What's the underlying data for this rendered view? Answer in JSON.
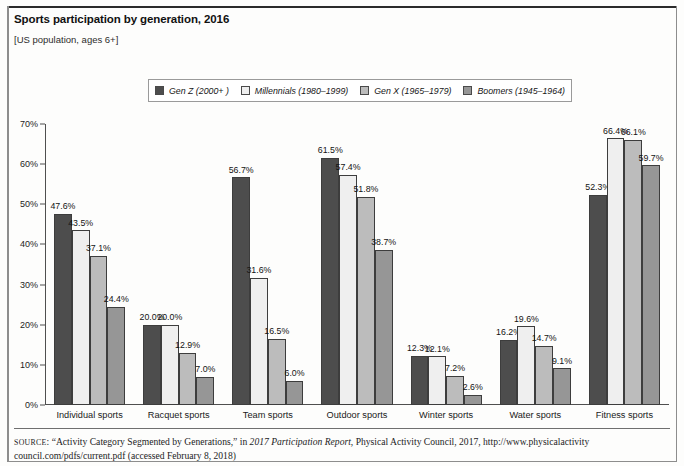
{
  "header": {
    "title": "Sports participation by generation, 2016",
    "subtitle": "[US population, ages 6+]"
  },
  "legend": {
    "items": [
      {
        "label": "Gen Z (2000+ )",
        "color": "#4d4d4d"
      },
      {
        "label": "Millennials (1980–1999)",
        "color": "#efefef"
      },
      {
        "label": "Gen X (1965–1979)",
        "color": "#bcbcbc"
      },
      {
        "label": "Boomers (1945–1964)",
        "color": "#969696"
      }
    ]
  },
  "source": {
    "prefix": "SOURCE",
    "text_before_italic": ": “Activity Category Segmented by Generations,” in ",
    "italic": "2017 Participation Report",
    "text_after_italic": ", Physical Activity Council, 2017, http://www.physicalactivity council.com/pdfs/current.pdf (accessed February 8, 2018)"
  },
  "chart_data": {
    "type": "bar",
    "title": "Sports participation by generation, 2016",
    "subtitle": "[US population, ages 6+]",
    "xlabel": "",
    "ylabel": "",
    "ylim": [
      0,
      70
    ],
    "ytick_labels": [
      "0%",
      "10%",
      "20%",
      "30%",
      "40%",
      "50%",
      "60%",
      "70%"
    ],
    "ytick_values": [
      0,
      10,
      20,
      30,
      40,
      50,
      60,
      70
    ],
    "grid": false,
    "legend_position": "top-center",
    "value_suffix": "%",
    "categories": [
      "Individual sports",
      "Racquet sports",
      "Team sports",
      "Outdoor sports",
      "Winter sports",
      "Water sports",
      "Fitness sports"
    ],
    "series": [
      {
        "name": "Gen Z (2000+ )",
        "color": "#4d4d4d",
        "values": [
          47.6,
          20.0,
          56.7,
          61.5,
          12.3,
          16.2,
          52.3
        ],
        "labels": [
          "47.6%",
          "20.0%",
          "56.7%",
          "61.5%",
          "12.3%",
          "16.2%",
          "52.3%"
        ]
      },
      {
        "name": "Millennials (1980–1999)",
        "color": "#efefef",
        "values": [
          43.5,
          20.0,
          31.6,
          57.4,
          12.1,
          19.6,
          66.4
        ],
        "labels": [
          "43.5%",
          "20.0%",
          "31.6%",
          "57.4%",
          "12.1%",
          "19.6%",
          "66.4%"
        ]
      },
      {
        "name": "Gen X (1965–1979)",
        "color": "#bcbcbc",
        "values": [
          37.1,
          12.9,
          16.5,
          51.8,
          7.2,
          14.7,
          66.1
        ],
        "labels": [
          "37.1%",
          "12.9%",
          "16.5%",
          "51.8%",
          "7.2%",
          "14.7%",
          "66.1%"
        ]
      },
      {
        "name": "Boomers (1945–1964)",
        "color": "#969696",
        "values": [
          24.4,
          7.0,
          6.0,
          38.7,
          2.6,
          9.1,
          59.7
        ],
        "labels": [
          "24.4%",
          "7.0%",
          "6.0%",
          "38.7%",
          "2.6%",
          "9.1%",
          "59.7%"
        ]
      }
    ]
  }
}
